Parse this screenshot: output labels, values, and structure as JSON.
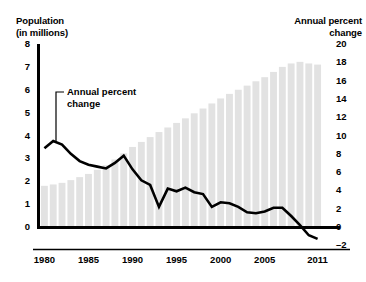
{
  "chart_data": {
    "type": "bar",
    "title": "",
    "subtitle": "",
    "xlabel": "",
    "ylabel": "Population (in millions)",
    "y2label": "Annual percent change",
    "grid": false,
    "legend_position": "none",
    "x": [
      1980,
      1981,
      1982,
      1983,
      1984,
      1985,
      1986,
      1987,
      1988,
      1989,
      1990,
      1991,
      1992,
      1993,
      1994,
      1995,
      1996,
      1997,
      1998,
      1999,
      2000,
      2001,
      2002,
      2003,
      2004,
      2005,
      2006,
      2007,
      2008,
      2009,
      2010,
      2011
    ],
    "xlim": [
      1979.5,
      2011.5
    ],
    "ylim": [
      0,
      8
    ],
    "y2lim": [
      -2,
      20
    ],
    "y_ticks": [
      0,
      1,
      2,
      3,
      4,
      5,
      6,
      7,
      8
    ],
    "y2_ticks": [
      -2,
      0,
      2,
      4,
      6,
      8,
      10,
      12,
      14,
      16,
      18,
      20
    ],
    "y2_tick_labels": [
      "-2",
      "0",
      "2",
      "4",
      "6",
      "8",
      "10",
      "12",
      "14",
      "16",
      "18",
      "20"
    ],
    "x_ticks": [
      1980,
      1985,
      1990,
      1995,
      2000,
      2005,
      2011
    ],
    "x_tick_labels": [
      "1980",
      "1985",
      "1990",
      "1995",
      "2000",
      "2005",
      "2011"
    ],
    "series": [
      {
        "name": "Population (in millions)",
        "type": "bar",
        "axis": "left",
        "color": "#e2e2e2",
        "values": [
          1.8,
          1.86,
          1.93,
          2.05,
          2.18,
          2.32,
          2.5,
          2.7,
          2.95,
          3.22,
          3.5,
          3.72,
          3.93,
          4.15,
          4.35,
          4.55,
          4.75,
          4.97,
          5.18,
          5.4,
          5.62,
          5.82,
          6.0,
          6.18,
          6.37,
          6.55,
          6.78,
          7.0,
          7.15,
          7.22,
          7.15,
          7.1
        ]
      },
      {
        "name": "Annual percent change",
        "type": "line",
        "axis": "right",
        "color": "#000000",
        "values": [
          8.6,
          9.4,
          9.0,
          8.0,
          7.2,
          6.8,
          6.6,
          6.4,
          7.0,
          7.8,
          6.3,
          5.1,
          4.6,
          2.2,
          4.2,
          3.9,
          4.3,
          3.8,
          3.6,
          2.2,
          2.7,
          2.6,
          2.2,
          1.6,
          1.5,
          1.7,
          2.1,
          2.1,
          1.2,
          0.2,
          -0.9,
          -1.3
        ]
      }
    ]
  },
  "axes": {
    "left_title_line1": "Population",
    "left_title_line2": "(in millions)",
    "right_title_line1": "Annual percent",
    "right_title_line2": "change"
  },
  "annotation": {
    "line1": "Annual percent",
    "line2": "change"
  }
}
